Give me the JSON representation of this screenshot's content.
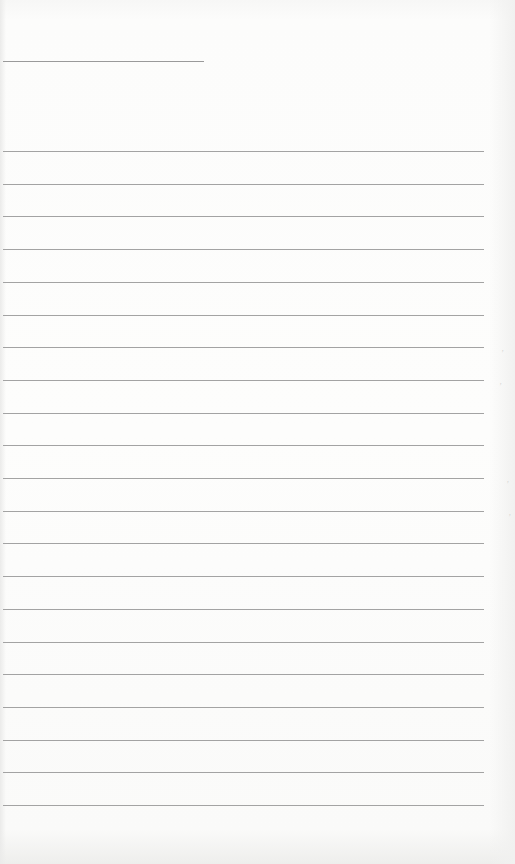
{
  "document": {
    "type": "lined-notepaper",
    "title_line": {
      "present": true
    },
    "rule_count": 21,
    "rule_start_y": 151,
    "rule_spacing": 32.7,
    "content_text": "",
    "colors": {
      "paper": "#fbfbfa",
      "rule": "#a3a3a3"
    }
  }
}
